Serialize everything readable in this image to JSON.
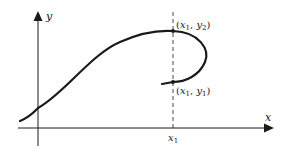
{
  "diagram": {
    "axes": {
      "x_label": "x",
      "y_label": "y"
    },
    "tick": {
      "label": "x",
      "subscript": "1"
    },
    "points": [
      {
        "id": "upper",
        "label_x": "x",
        "label_x_sub": "1",
        "label_y": "y",
        "label_y_sub": "2"
      },
      {
        "id": "lower",
        "label_x": "x",
        "label_x_sub": "1",
        "label_y": "y",
        "label_y_sub": "1"
      }
    ],
    "colors": {
      "ink": "#1a1a1a",
      "background": "#ffffff"
    }
  }
}
